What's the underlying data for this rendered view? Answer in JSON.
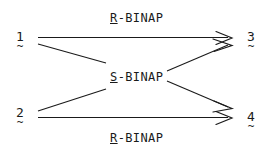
{
  "scheme": {
    "title": "BINAP catalyzed transformation scheme",
    "background_color": "#ffffff",
    "line_color": "#1a1a1a",
    "nodes": [
      {
        "id": "node-1",
        "number": "1",
        "tilde": "~",
        "position": "left-top"
      },
      {
        "id": "node-2",
        "number": "2",
        "tilde": "~",
        "position": "left-bottom"
      },
      {
        "id": "node-3",
        "number": "3",
        "tilde": "~",
        "position": "right-top"
      },
      {
        "id": "node-4",
        "number": "4",
        "tilde": "~",
        "position": "right-bottom"
      }
    ],
    "reagents": [
      {
        "id": "reagent-top",
        "stereo": "R",
        "rest": "-BINAP",
        "full": "R-BINAP",
        "position": "top"
      },
      {
        "id": "reagent-middle",
        "stereo": "S",
        "rest": "-BINAP",
        "full": "S-BINAP",
        "position": "middle"
      },
      {
        "id": "reagent-bottom",
        "stereo": "R",
        "rest": "-BINAP",
        "full": "R-BINAP",
        "position": "bottom"
      }
    ],
    "arrows": [
      {
        "id": "arrow-1-to-3",
        "from": "1",
        "to": "3",
        "reagent": "R-BINAP",
        "style": "horizontal-top"
      },
      {
        "id": "arrow-2-to-4",
        "from": "2",
        "to": "4",
        "reagent": "R-BINAP",
        "style": "horizontal-bottom"
      },
      {
        "id": "arrow-1-to-4",
        "from": "1",
        "to": "4",
        "reagent": "S-BINAP",
        "style": "diagonal-descending"
      },
      {
        "id": "arrow-2-to-3",
        "from": "2",
        "to": "3",
        "reagent": "S-BINAP",
        "style": "diagonal-ascending"
      }
    ]
  }
}
